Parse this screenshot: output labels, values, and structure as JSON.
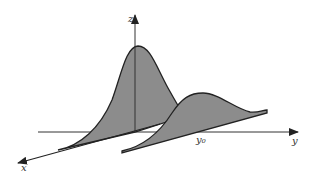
{
  "diagram": {
    "axes": {
      "x_label": "x",
      "y_label": "y",
      "z_label": "z"
    },
    "annotations": {
      "y0_label": "y₀"
    },
    "curves": [
      {
        "name": "tall-gaussian",
        "position": "origin"
      },
      {
        "name": "short-gaussian",
        "position": "y0"
      }
    ],
    "colors": {
      "fill": "#8c8c8c",
      "stroke": "#222222",
      "axis": "#333333"
    }
  }
}
